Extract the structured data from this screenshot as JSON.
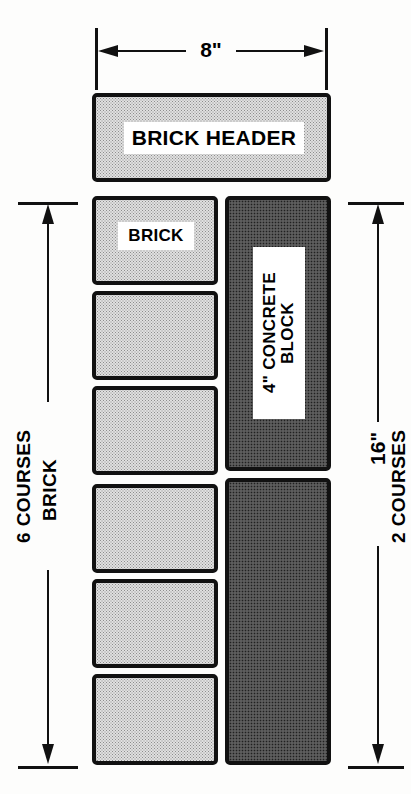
{
  "diagram": {
    "units": {
      "brick_header": {
        "label": "BRICK HEADER",
        "fill": "light-stipple"
      },
      "brick": {
        "label": "BRICK",
        "fill": "light-stipple"
      },
      "concrete_block": {
        "label": "4\" CONCRETE\nBLOCK",
        "fill": "dark-stipple"
      }
    },
    "dimensions": {
      "width": {
        "value": "8\"",
        "orientation": "horizontal",
        "position": "top"
      },
      "left": {
        "line1": "6 COURSES",
        "line2": "BRICK",
        "orientation": "vertical",
        "position": "left"
      },
      "right_measure": {
        "value": "16\"",
        "orientation": "vertical",
        "position": "right"
      },
      "right_count": {
        "value": "2 COURSES",
        "orientation": "vertical",
        "position": "right"
      }
    },
    "colors": {
      "line": "#111111",
      "brick_fill": "#e0e0e0",
      "block_fill": "#9a9a9a",
      "background": "#fdfdfc"
    }
  }
}
